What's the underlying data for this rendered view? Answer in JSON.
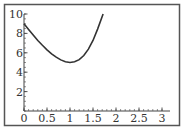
{
  "chart_data": {
    "type": "line",
    "title": "",
    "xlabel": "",
    "ylabel": "",
    "xlim": [
      0,
      3
    ],
    "ylim": [
      0,
      10
    ],
    "grid": false,
    "legend": null,
    "x_ticks": [
      "0",
      "0.5",
      "1",
      "1.5",
      "2",
      "2.5",
      "3"
    ],
    "y_ticks": [
      "2",
      "4",
      "6",
      "8",
      "10"
    ],
    "series": [
      {
        "name": "curve",
        "x": [
          0,
          0.1,
          0.2,
          0.3,
          0.4,
          0.5,
          0.6,
          0.7,
          0.8,
          0.9,
          1.0,
          1.1,
          1.2,
          1.3,
          1.4,
          1.5,
          1.6,
          1.72
        ],
        "y": [
          9.0,
          8.4,
          7.82,
          7.27,
          6.77,
          6.31,
          5.9,
          5.55,
          5.27,
          5.07,
          5.0,
          5.07,
          5.3,
          5.72,
          6.38,
          7.27,
          8.44,
          10.0
        ]
      }
    ]
  }
}
